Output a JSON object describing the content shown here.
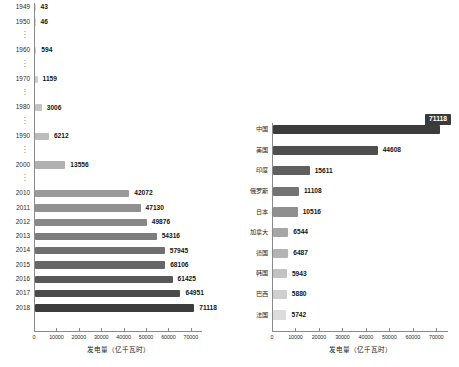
{
  "chart_data": [
    {
      "id": "left",
      "type": "bar",
      "orientation": "horizontal",
      "title": "",
      "xlabel": "发电量（亿千瓦时）",
      "ylabel": "",
      "xlim": [
        0,
        75000
      ],
      "xticks": [
        0,
        10000,
        20000,
        30000,
        40000,
        50000,
        60000,
        70000
      ],
      "xticklabels": [
        "0",
        "10000",
        "20000",
        "30000",
        "40000",
        "50000",
        "60000",
        "70000"
      ],
      "grid": false,
      "legend": "none",
      "categories": [
        "1949",
        "1950",
        "⋮",
        "1960",
        "⋮",
        "1970",
        "⋮",
        "1980",
        "⋮",
        "1990",
        "⋮",
        "2000",
        "⋮",
        "2010",
        "2011",
        "2012",
        "2013",
        "2014",
        "2015",
        "2016",
        "2017",
        "2018"
      ],
      "rows": [
        {
          "category": "1949",
          "is_gap": false,
          "value": 43,
          "label": "43",
          "bar_value": 43,
          "color": "#d8d8d8"
        },
        {
          "category": "1950",
          "is_gap": false,
          "value": 46,
          "label": "46",
          "bar_value": 46,
          "color": "#d6d6d6"
        },
        {
          "category": "⋮",
          "is_gap": true,
          "value": null,
          "label": "",
          "bar_value": null,
          "color": ""
        },
        {
          "category": "1960",
          "is_gap": false,
          "value": 594,
          "label": "594",
          "bar_value": 594,
          "color": "#d2d2d2"
        },
        {
          "category": "⋮",
          "is_gap": true,
          "value": null,
          "label": "",
          "bar_value": null,
          "color": ""
        },
        {
          "category": "1970",
          "is_gap": false,
          "value": 1159,
          "label": "1159",
          "bar_value": 1159,
          "color": "#cccccc"
        },
        {
          "category": "⋮",
          "is_gap": true,
          "value": null,
          "label": "",
          "bar_value": null,
          "color": ""
        },
        {
          "category": "1980",
          "is_gap": false,
          "value": 3006,
          "label": "3006",
          "bar_value": 3006,
          "color": "#c4c4c4"
        },
        {
          "category": "⋮",
          "is_gap": true,
          "value": null,
          "label": "",
          "bar_value": null,
          "color": ""
        },
        {
          "category": "1990",
          "is_gap": false,
          "value": 6212,
          "label": "6212",
          "bar_value": 6212,
          "color": "#bcbcbc"
        },
        {
          "category": "⋮",
          "is_gap": true,
          "value": null,
          "label": "",
          "bar_value": null,
          "color": ""
        },
        {
          "category": "2000",
          "is_gap": false,
          "value": 13556,
          "label": "13556",
          "bar_value": 13556,
          "color": "#b0b0b0"
        },
        {
          "category": "⋮",
          "is_gap": true,
          "value": null,
          "label": "",
          "bar_value": null,
          "color": ""
        },
        {
          "category": "2010",
          "is_gap": false,
          "value": 42072,
          "label": "42072",
          "bar_value": 42072,
          "color": "#9a9a9a"
        },
        {
          "category": "2011",
          "is_gap": false,
          "value": 47130,
          "label": "47130",
          "bar_value": 47130,
          "color": "#909090"
        },
        {
          "category": "2012",
          "is_gap": false,
          "value": 49876,
          "label": "49876",
          "bar_value": 49876,
          "color": "#878787"
        },
        {
          "category": "2013",
          "is_gap": false,
          "value": 54316,
          "label": "54316",
          "bar_value": 54316,
          "color": "#7d7d7d"
        },
        {
          "category": "2014",
          "is_gap": false,
          "value": 57945,
          "label": "57945",
          "bar_value": 57945,
          "color": "#6f6f6f"
        },
        {
          "category": "2015",
          "is_gap": false,
          "value": 68106,
          "label": "68106",
          "bar_value": 58106,
          "color": "#666666"
        },
        {
          "category": "2016",
          "is_gap": false,
          "value": 61425,
          "label": "61425",
          "bar_value": 61425,
          "color": "#585858"
        },
        {
          "category": "2017",
          "is_gap": false,
          "value": 64951,
          "label": "64951",
          "bar_value": 64951,
          "color": "#4b4b4b"
        },
        {
          "category": "2018",
          "is_gap": false,
          "value": 71118,
          "label": "71118",
          "bar_value": 71118,
          "color": "#3c3c3c"
        }
      ]
    },
    {
      "id": "right",
      "type": "bar",
      "orientation": "horizontal",
      "title": "",
      "xlabel": "发电量（亿千瓦时）",
      "ylabel": "",
      "xlim": [
        0,
        75000
      ],
      "xticks": [
        0,
        10000,
        20000,
        30000,
        40000,
        50000,
        60000,
        70000
      ],
      "xticklabels": [
        "0",
        "10000",
        "20000",
        "30000",
        "40000",
        "50000",
        "60000",
        "70000"
      ],
      "grid": false,
      "legend": "none",
      "highlight": {
        "category": "中国",
        "value": 71118,
        "label": "71118"
      },
      "categories": [
        "中国",
        "美国",
        "印度",
        "俄罗斯",
        "日本",
        "加拿大",
        "德国",
        "韩国",
        "巴西",
        "法国"
      ],
      "rows": [
        {
          "category": "中国",
          "value": 71118,
          "label": "71118",
          "color": "#3c3c3c",
          "callout": true
        },
        {
          "category": "美国",
          "value": 44608,
          "label": "44608",
          "color": "#4e4e4e",
          "callout": false
        },
        {
          "category": "印度",
          "value": 15611,
          "label": "15611",
          "color": "#5f5f5f",
          "callout": false
        },
        {
          "category": "俄罗斯",
          "value": 11108,
          "label": "11108",
          "color": "#737373",
          "callout": false
        },
        {
          "category": "日本",
          "value": 10516,
          "label": "10516",
          "color": "#8f8f8f",
          "callout": false
        },
        {
          "category": "加拿大",
          "value": 6544,
          "label": "6544",
          "color": "#a6a6a6",
          "callout": false
        },
        {
          "category": "德国",
          "value": 6487,
          "label": "6487",
          "color": "#b4b4b4",
          "callout": false
        },
        {
          "category": "韩国",
          "value": 5943,
          "label": "5943",
          "color": "#c2c2c2",
          "callout": false
        },
        {
          "category": "巴西",
          "value": 5880,
          "label": "5880",
          "color": "#cfcfcf",
          "callout": false
        },
        {
          "category": "法国",
          "value": 5742,
          "label": "5742",
          "color": "#dcdcdc",
          "callout": false
        }
      ]
    }
  ],
  "colors": {
    "axis": "#8a8a8a",
    "text": "#1a1a1a",
    "callout_bg": "#3a3a3a",
    "callout_text": "#ffffff",
    "background": "#ffffff"
  }
}
